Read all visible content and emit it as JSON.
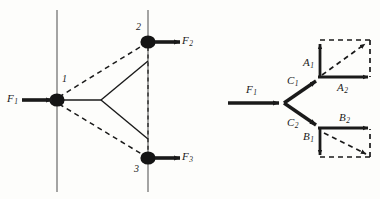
{
  "figure": {
    "background_color": "#fdfdfb",
    "stroke_color": "#1a1a1a",
    "width": 380,
    "height": 199
  },
  "left_diagram": {
    "name": "truss-joint-diagram",
    "nodes": [
      {
        "id": "1",
        "label": "1",
        "x": 57,
        "y": 100
      },
      {
        "id": "2",
        "label": "2",
        "x": 148,
        "y": 42
      },
      {
        "id": "3",
        "label": "3",
        "x": 148,
        "y": 158
      }
    ],
    "forces": [
      {
        "label": "F",
        "sub": "1",
        "direction": "right",
        "at_node": "1"
      },
      {
        "label": "F",
        "sub": "2",
        "direction": "right",
        "at_node": "2"
      },
      {
        "label": "F",
        "sub": "3",
        "direction": "right",
        "at_node": "3"
      }
    ],
    "members": {
      "dashed": [
        "1-2",
        "1-3",
        "2-3"
      ],
      "solid": [
        "1-apex",
        "apex-upper",
        "apex-lower"
      ]
    },
    "guide_lines": [
      {
        "name": "left-vertical-guide",
        "x": 57
      },
      {
        "name": "right-vertical-guide",
        "x": 148
      }
    ]
  },
  "right_diagram": {
    "name": "vector-resolution-diagram",
    "input_force": {
      "label": "F",
      "sub": "1"
    },
    "branches": [
      {
        "name": "upper-branch",
        "resultant": {
          "label": "C",
          "sub": "1"
        },
        "components": [
          {
            "label": "A",
            "sub": "1",
            "direction": "up"
          },
          {
            "label": "A",
            "sub": "2",
            "direction": "right"
          }
        ],
        "parallelogram": "dashed",
        "diagonal": "dashed-arrow"
      },
      {
        "name": "lower-branch",
        "resultant": {
          "label": "C",
          "sub": "2"
        },
        "components": [
          {
            "label": "B",
            "sub": "1",
            "direction": "down"
          },
          {
            "label": "B",
            "sub": "2",
            "direction": "right"
          }
        ],
        "parallelogram": "dashed",
        "diagonal": "dashed-arrow"
      }
    ]
  },
  "labels": {
    "F1_left": "F",
    "F1_left_sub": "1",
    "F2": "F",
    "F2_sub": "2",
    "F3": "F",
    "F3_sub": "3",
    "node1": "1",
    "node2": "2",
    "node3": "3",
    "F1_right": "F",
    "F1_right_sub": "1",
    "C1": "C",
    "C1_sub": "1",
    "C2": "C",
    "C2_sub": "2",
    "A1": "A",
    "A1_sub": "1",
    "A2": "A",
    "A2_sub": "2",
    "B1": "B",
    "B1_sub": "1",
    "B2": "B",
    "B2_sub": "2"
  }
}
